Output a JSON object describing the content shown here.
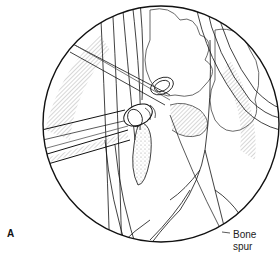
{
  "figure": {
    "panel_label": "A",
    "callout": {
      "line1": "Bone",
      "line2": "spur"
    },
    "colors": {
      "line": "#111111",
      "hatch": "#666666",
      "background": "#ffffff"
    }
  }
}
